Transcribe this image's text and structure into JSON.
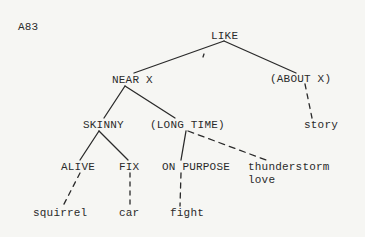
{
  "figure_id": "A83",
  "nodes": {
    "like": "LIKE",
    "near_x": "NEAR X",
    "about_x": "(ABOUT X)",
    "skinny": "SKINNY",
    "long_time": "(LONG TIME)",
    "story": "story",
    "alive": "ALIVE",
    "fix": "FIX",
    "on_purpose": "ON PURPOSE",
    "thunderstorm_love_line1": "thunderstorm",
    "thunderstorm_love_line2": "love",
    "squirrel": "squirrel",
    "car": "car",
    "fight": "fight"
  },
  "edges": [
    {
      "from": "LIKE",
      "to": "NEAR X",
      "style": "solid"
    },
    {
      "from": "LIKE",
      "to": "(ABOUT X)",
      "style": "solid"
    },
    {
      "from": "(ABOUT X)",
      "to": "story",
      "style": "dashed"
    },
    {
      "from": "NEAR X",
      "to": "SKINNY",
      "style": "solid"
    },
    {
      "from": "NEAR X",
      "to": "(LONG TIME)",
      "style": "solid"
    },
    {
      "from": "SKINNY",
      "to": "ALIVE",
      "style": "solid"
    },
    {
      "from": "SKINNY",
      "to": "FIX",
      "style": "solid"
    },
    {
      "from": "(LONG TIME)",
      "to": "ON PURPOSE",
      "style": "solid"
    },
    {
      "from": "(LONG TIME)",
      "to": "thunderstorm love",
      "style": "dashed"
    },
    {
      "from": "ALIVE",
      "to": "squirrel",
      "style": "dashed"
    },
    {
      "from": "FIX",
      "to": "car",
      "style": "dashed"
    },
    {
      "from": "ON PURPOSE",
      "to": "fight",
      "style": "dashed"
    }
  ],
  "colors": {
    "ink": "#2a2a2a",
    "paper": "#f6f6f3"
  }
}
